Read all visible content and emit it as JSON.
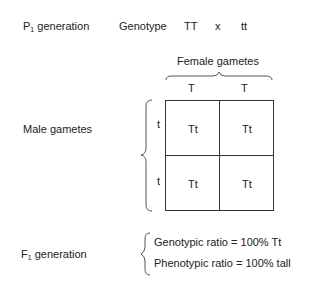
{
  "p1": {
    "label_main": "P",
    "label_sub": "1",
    "label_rest": " generation",
    "genotype_label": "Genotype",
    "parent1": "TT",
    "cross": "x",
    "parent2": "tt"
  },
  "female_gametes": {
    "title": "Female gametes",
    "alleles": [
      "T",
      "T"
    ]
  },
  "male_gametes": {
    "title": "Male gametes",
    "alleles": [
      "t",
      "t"
    ]
  },
  "punnett": {
    "cells": [
      [
        "Tt",
        "Tt"
      ],
      [
        "Tt",
        "Tt"
      ]
    ]
  },
  "f1": {
    "label_main": "F",
    "label_sub": "1",
    "label_rest": " generation",
    "genotypic_ratio": "Genotypic ratio = 100% Tt",
    "phenotypic_ratio": "Phenotypic ratio = 100% tall"
  }
}
